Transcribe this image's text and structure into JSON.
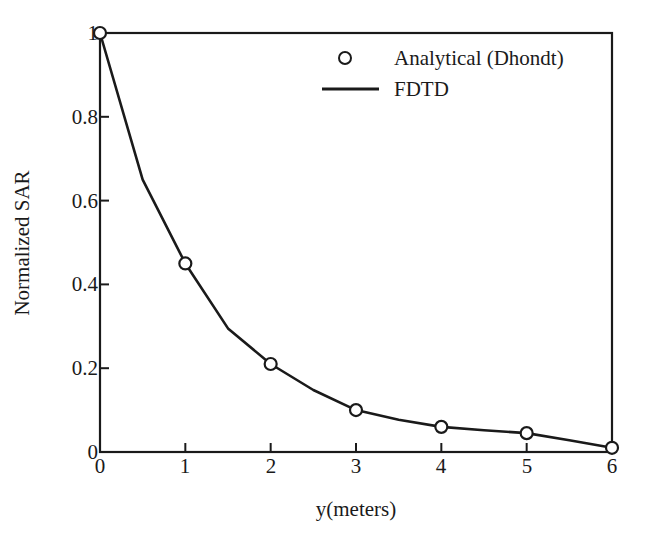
{
  "chart_data": {
    "type": "line",
    "title": "",
    "xlabel": "y(meters)",
    "ylabel": "Normalized SAR",
    "xlim": [
      0,
      6
    ],
    "ylim": [
      0,
      1
    ],
    "xticks": [
      "0",
      "1",
      "2",
      "3",
      "4",
      "5",
      "6"
    ],
    "xtick_values": [
      0,
      1,
      2,
      3,
      4,
      5,
      6
    ],
    "yticks": [
      "0",
      "0.2",
      "0.4",
      "0.6",
      "0.8",
      "1"
    ],
    "ytick_values": [
      0,
      0.2,
      0.4,
      0.6,
      0.8,
      1
    ],
    "grid": false,
    "legend_position": "top-right",
    "series": [
      {
        "name": "Analytical (Dhondt)",
        "style": "marker",
        "marker": "open-circle",
        "color": "#1a1a1a",
        "x": [
          0,
          1,
          2,
          3,
          4,
          5,
          6
        ],
        "values": [
          1.0,
          0.45,
          0.21,
          0.1,
          0.06,
          0.045,
          0.01
        ]
      },
      {
        "name": "FDTD",
        "style": "line",
        "color": "#1a1a1a",
        "x": [
          0,
          0.5,
          1.0,
          1.5,
          2.0,
          2.5,
          3.0,
          3.5,
          4.0,
          4.5,
          5.0,
          5.5,
          6.0
        ],
        "values": [
          1.0,
          0.65,
          0.45,
          0.295,
          0.21,
          0.148,
          0.1,
          0.077,
          0.06,
          0.052,
          0.045,
          0.028,
          0.01
        ]
      }
    ]
  },
  "axes": {
    "x_title": "y(meters)",
    "y_title": "Normalized SAR"
  },
  "legend": {
    "entries": [
      {
        "label": "Analytical (Dhondt)",
        "marker": "open-circle"
      },
      {
        "label": "FDTD",
        "marker": "line"
      }
    ]
  },
  "style": {
    "background": "#ffffff",
    "ink": "#1a1a1a",
    "spine": "#1a1a1a"
  }
}
